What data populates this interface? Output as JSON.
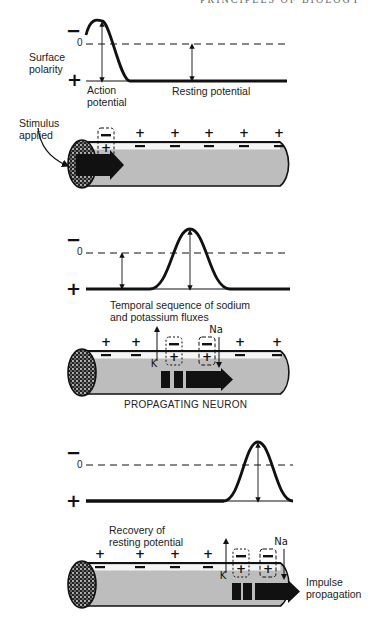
{
  "header": {
    "running_head": "PRINCIPLES OF BIOLOGY"
  },
  "colors": {
    "ink": "#111111",
    "axon_fill": "#bdbdbd",
    "axon_highlight": "#f4f4f4",
    "background": "#ffffff"
  },
  "axis": {
    "minus": "−",
    "zero": "0",
    "plus": "+"
  },
  "panel1": {
    "graph": {
      "y_label": "Surface\npolarity",
      "action_label": "Action\npotential",
      "resting_label": "Resting potential",
      "dash_y": 44,
      "base_y": 81,
      "x_start": 86,
      "x_end": 287,
      "peak_x": 102,
      "peak_y": 21,
      "rise_start": 90,
      "fall_end": 130,
      "resting_arrow_x": 192
    },
    "neuron": {
      "stimulus_label": "Stimulus\napplied",
      "top": 142,
      "bottom": 186,
      "outer_plus": [
        "+",
        "+",
        "+",
        "+",
        "+"
      ],
      "inner_minus": [
        "−",
        "−",
        "−",
        "−",
        "−"
      ],
      "plus_x": [
        140,
        175,
        209,
        244,
        279
      ],
      "box": {
        "x": 98,
        "outer": "−",
        "inner": "+"
      }
    }
  },
  "panel2": {
    "graph": {
      "caption": "Temporal sequence of sodium\nand potassium fluxes",
      "dash_y": 253,
      "base_y": 289,
      "x_start": 86,
      "x_end": 290,
      "peak_x": 190,
      "peak_y": 229,
      "rise_start": 150,
      "fall_end": 230,
      "resting_arrow_x": 122
    },
    "neuron": {
      "title": "PROPAGATING NEURON",
      "top": 351,
      "bottom": 394,
      "plus_x": [
        106,
        136,
        240,
        277
      ],
      "outer_plus": [
        "+",
        "+",
        "+",
        "+"
      ],
      "inner_minus": [
        "−",
        "−",
        "−",
        "−"
      ],
      "k_label": "K",
      "na_label": "Na",
      "k_x": 157,
      "na_x": 219,
      "box_dotted": {
        "x": 166,
        "outer": "−",
        "inner": "+"
      },
      "box_dashed": {
        "x": 199,
        "outer": "−",
        "inner": "+"
      },
      "blocks_x": [
        161,
        174
      ],
      "arrow_x": 186,
      "arrow_end": 233
    }
  },
  "panel3": {
    "graph": {
      "caption": "Recovery of\nresting potential",
      "dash_y": 465,
      "base_y": 501,
      "x_start": 86,
      "x_end": 293,
      "peak_x": 258,
      "peak_y": 442,
      "rise_start": 224,
      "fall_end": 293
    },
    "neuron": {
      "propagation_label": "Impulse\npropagation",
      "top": 563,
      "bottom": 606,
      "plus_x": [
        100,
        140,
        175,
        208
      ],
      "outer_plus": [
        "+",
        "+",
        "+",
        "+"
      ],
      "inner_minus": [
        "−",
        "−",
        "−",
        "−"
      ],
      "k_label": "K",
      "na_label": "Na",
      "k_x": 226,
      "na_x": 284,
      "box_dotted": {
        "x": 233,
        "outer": "−",
        "inner": "+"
      },
      "box_dashed": {
        "x": 260,
        "outer": "−",
        "inner": "+"
      },
      "blocks_x": [
        232,
        243
      ],
      "arrow_x": 255,
      "arrow_end": 300
    }
  }
}
